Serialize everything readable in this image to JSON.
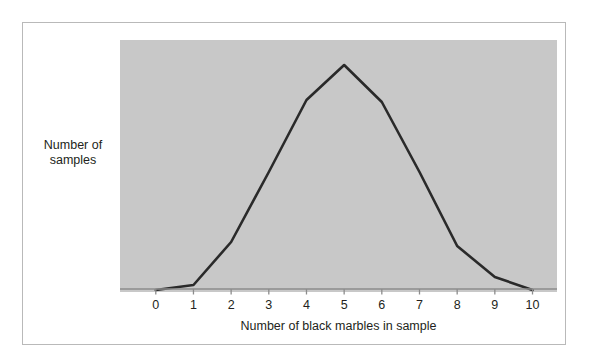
{
  "figure": {
    "background_color": "#ffffff",
    "frame_color": "#b9b9b9",
    "plot_background_color": "#c8c8c8",
    "line_color": "#2a2a2a",
    "text_color": "#231f20"
  },
  "chart_data": {
    "type": "line",
    "title": "",
    "xlabel": "Number of black marbles in sample",
    "ylabel": "Number of samples",
    "ylabel_lines": [
      "Number of",
      "samples"
    ],
    "categories": [
      "0",
      "1",
      "2",
      "3",
      "4",
      "5",
      "6",
      "7",
      "8",
      "9",
      "10"
    ],
    "x": [
      0,
      1,
      2,
      3,
      4,
      5,
      6,
      7,
      8,
      9,
      10
    ],
    "values": [
      2,
      7,
      50,
      120,
      192,
      227,
      190,
      120,
      46,
      15,
      2
    ],
    "xlim": [
      -0.95,
      10.65
    ],
    "ylim": [
      0,
      252
    ],
    "x_tick_labels": [
      "0",
      "1",
      "2",
      "3",
      "4",
      "5",
      "6",
      "7",
      "8",
      "9",
      "10"
    ],
    "y_tick_labels": [],
    "grid": false,
    "legend": null,
    "legend_position": "none",
    "annotations": []
  }
}
